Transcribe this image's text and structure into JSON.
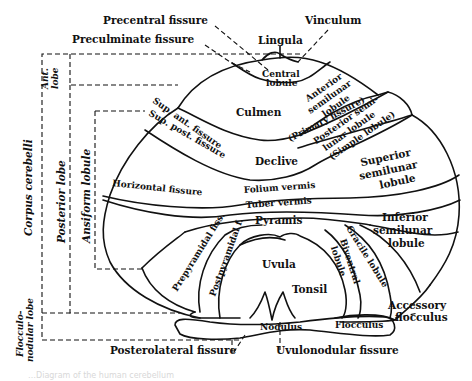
{
  "figure": {
    "caption": "…Diagram of the human cerebellum"
  },
  "top_labels": {
    "precentral_fissure": "Precentral fissure",
    "vinculum": "Vinculum",
    "preculminate_fissure": "Preculminate fissure",
    "lingula": "Lingula"
  },
  "vermis_labels": {
    "central_lobule": [
      "Central",
      "lobule"
    ],
    "culmen": "Culmen",
    "declive": "Declive",
    "folium_vermis": "Folium vermis",
    "tuber_vermis": "Tuber vermis",
    "pyramis": "Pyramis",
    "uvula": "Uvula",
    "tonsil": "Tonsil",
    "nodulus": "Nodulus"
  },
  "hemisphere_labels": {
    "anterior_semilunar_lobule": [
      "Anterior",
      "semilunar",
      "lobule"
    ],
    "primary_fissure": "(Primary fissure)",
    "posterior_semilunar_lobule": [
      "Posterior semi-",
      "lunar lobule",
      "(Simple lobule)"
    ],
    "superior_semilunar_lobule": [
      "Superior",
      "semilunar",
      "lobule"
    ],
    "inferior_semilunar_lobule": [
      "Inferior",
      "semilunar",
      "lobule"
    ],
    "gracile_lobule": "Gracile lobule",
    "biventral_lobule": [
      "Biventral",
      "lobule"
    ],
    "flocculus": "Flocculus",
    "accessory_flocculus": [
      "Accessory",
      "flocculus"
    ]
  },
  "fissure_labels": {
    "sup_ant_fissure": "Sup. ant. fissure",
    "sup_post_fissure": "Sup. post. fissure",
    "horizontal_fissure": "Horizontal fissure",
    "prepyramidal_fiss": "Prepyramidal fiss.",
    "postpyramidal_f": "Postpyramidal f.",
    "posterolateral_fissure": "Posterolateral fissure",
    "uvulonodular_fissure": "Uvulonodular fissure"
  },
  "bracket_labels": {
    "ant_lobe": [
      "Ant.",
      "lobe"
    ],
    "corpus_cerebelli": "Corpus cerebelli",
    "posterior_lobe": "Posterior lobe",
    "ansiform_lobule": "Ansiform lobule",
    "flocculonodular_lobe": [
      "Flocculo-",
      "nodular lobe"
    ]
  },
  "colors": {
    "ink": "#111111",
    "paper": "#ffffff"
  }
}
